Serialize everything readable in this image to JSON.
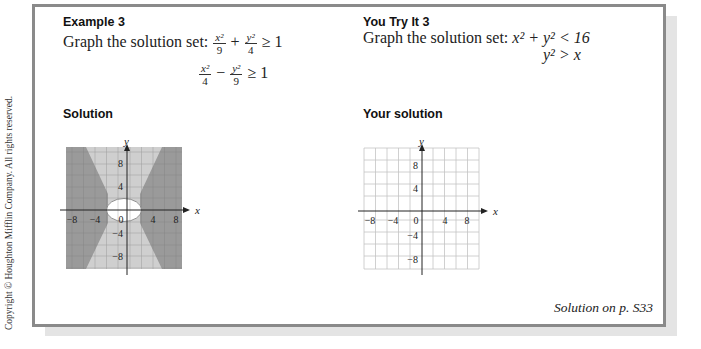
{
  "copyright": "Copyright © Houghton Mifflin Company. All rights reserved.",
  "example": {
    "heading": "Example 3",
    "prompt": "Graph the solution set:",
    "ineq1": {
      "term1_num": "x²",
      "term1_den": "9",
      "op": "+",
      "term2_num": "y²",
      "term2_den": "4",
      "rel": "≥ 1"
    },
    "ineq2": {
      "term1_num": "x²",
      "term1_den": "4",
      "op": "−",
      "term2_num": "y²",
      "term2_den": "9",
      "rel": "≥ 1"
    },
    "solution_label": "Solution"
  },
  "you_try": {
    "heading": "You Try It 3",
    "prompt": "Graph the solution set:",
    "ineq1": "x² + y² < 16",
    "ineq2": "y² > x",
    "solution_label": "Your solution"
  },
  "footer": "Solution on p. S33",
  "graph": {
    "x_label": "x",
    "y_label": "y",
    "x_ticks": [
      "−8",
      "−4",
      "0",
      "4",
      "8"
    ],
    "y_ticks": [
      "8",
      "4",
      "−4",
      "−8"
    ]
  },
  "colors": {
    "dark_shade": "#9a9a9a",
    "light_shade": "#cfcfcf",
    "border": "#8a8a8a",
    "grid": "#bdbdbd"
  }
}
